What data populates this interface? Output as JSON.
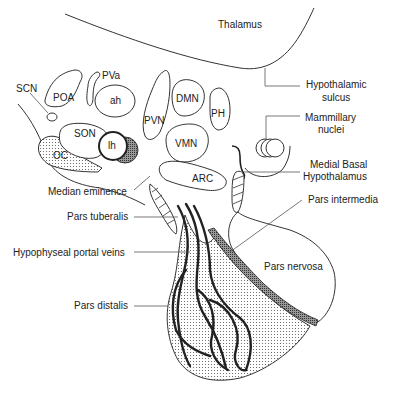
{
  "diagram": {
    "type": "anatomical-diagram",
    "regions": {
      "thalamus": "Thalamus",
      "hypothalamic_sulcus": "Hypothalamic sulcus",
      "mammillary_nuclei": "Mammillary nuclei",
      "medial_basal_hypothalamus": "Medial Basal Hypothalamus",
      "pars_intermedia": "Pars intermedia",
      "pars_nervosa": "Pars nervosa",
      "pars_distalis": "Pars distalis",
      "pars_tuberalis": "Pars tuberalis",
      "hypophyseal_portal_veins": "Hypophyseal portal veins",
      "median_eminence": "Median eminence"
    },
    "nuclei": {
      "scn": "SCN",
      "poa": "POA",
      "pva": "PVa",
      "ah": "ah",
      "pvn": "PVN",
      "dmn": "DMN",
      "ph": "PH",
      "son": "SON",
      "lh": "lh",
      "vmn": "VMN",
      "arc": "ARC",
      "oc": "OC"
    },
    "labels": {
      "hypothalamic_sulcus_l1": "Hypothalamic",
      "hypothalamic_sulcus_l2": "sulcus",
      "mammillary_l1": "Mammillary",
      "mammillary_l2": "nuclei",
      "mbh_l1": "Medial Basal",
      "mbh_l2": "Hypothalamus"
    },
    "colors": {
      "line": "#333333",
      "background": "#ffffff",
      "stipple": "#555555"
    }
  }
}
